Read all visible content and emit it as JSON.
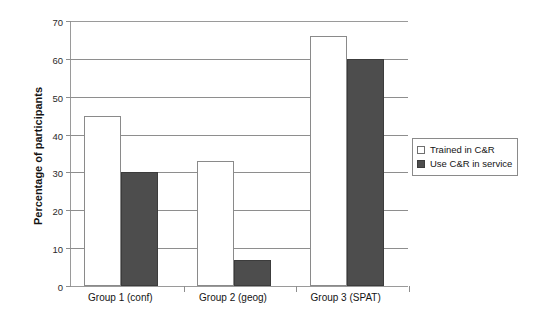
{
  "chart_data": {
    "type": "bar",
    "title": "",
    "subtitle": "",
    "xlabel": "",
    "ylabel": "Percentage of participants",
    "categories": [
      "Group 1 (conf)",
      "Group 2 (geog)",
      "Group 3 (SPAT)"
    ],
    "series": [
      {
        "name": "Trained in C&R",
        "values": [
          45,
          33,
          66
        ],
        "color": "#ffffff",
        "border": "#8a8a8a"
      },
      {
        "name": "Use C&R in service",
        "values": [
          30,
          7,
          60
        ],
        "color": "#4d4d4d",
        "border": "#3c3c3c"
      }
    ],
    "ylim": [
      0,
      70
    ],
    "yticks": [
      0,
      10,
      20,
      30,
      40,
      50,
      60,
      70
    ],
    "ytick_labels": [
      "0",
      "10",
      "20",
      "30",
      "40",
      "50",
      "60",
      "70"
    ],
    "grid": "horizontal",
    "legend_position": "right",
    "legend_entries": [
      "Trained in C&R",
      "Use C&R in service"
    ],
    "annotations": []
  },
  "axes": {
    "y_title": "Percentage of participants",
    "y_tick_labels": [
      "70",
      "60",
      "50",
      "40",
      "30",
      "20",
      "10",
      "0"
    ],
    "x_tick_labels": [
      "Group 1 (conf)",
      "Group 2 (geog)",
      "Group 3 (SPAT)"
    ]
  },
  "legend": {
    "items": [
      {
        "label": "Trained in C&R",
        "swatch": "legend-swatch-light"
      },
      {
        "label": "Use C&R in service",
        "swatch": "legend-swatch-dark"
      }
    ]
  }
}
